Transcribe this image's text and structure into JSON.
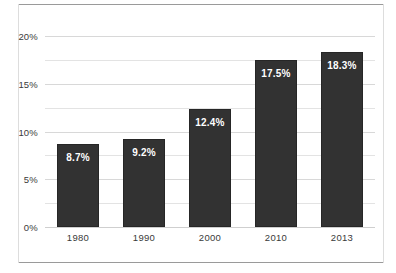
{
  "chart_data": {
    "type": "bar",
    "title": "",
    "subtitle": "",
    "xlabel": "",
    "ylabel": "",
    "categories": [
      "1980",
      "1990",
      "2000",
      "2010",
      "2013"
    ],
    "values": [
      8.7,
      9.2,
      12.4,
      17.5,
      18.3
    ],
    "data_labels": [
      "8.7%",
      "9.2%",
      "12.4%",
      "17.5%",
      "18.3%"
    ],
    "series": [
      {
        "name": "",
        "values": [
          8.7,
          9.2,
          12.4,
          17.5,
          18.3
        ]
      }
    ],
    "ylim": [
      0,
      20
    ],
    "ytick_values": [
      0,
      5,
      10,
      15,
      20
    ],
    "ytick_labels": [
      "0%",
      "5%",
      "10%",
      "15%",
      "20%"
    ],
    "minor_ytick_values": [
      2.5,
      7.5,
      12.5,
      17.5
    ],
    "grid": true,
    "grid_axis": "y",
    "legend": false,
    "legend_position": "none",
    "bar_color": "#323232",
    "bar_edge_color": "#262626",
    "data_label_color": "#ffffff",
    "gridline_color": "#e3e3e3",
    "axis_text_color": "#3a3a3a",
    "frame_color": "#9a9a9a",
    "background_color": "#ffffff",
    "annotations": []
  }
}
